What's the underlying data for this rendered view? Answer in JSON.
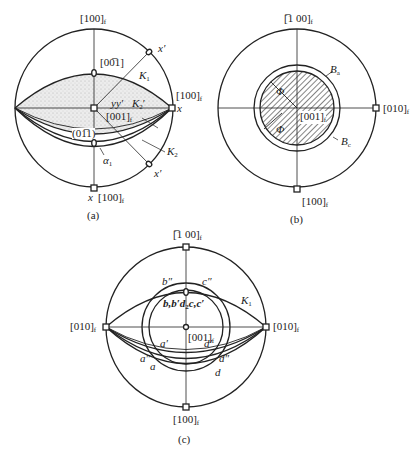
{
  "figure": {
    "panels": [
      {
        "id": "a",
        "caption": "(a)",
        "labels": {
          "top": "[100]",
          "top_sub": "f",
          "right": "[100]",
          "right_sub": "f",
          "right_x": "x",
          "bottom_x": "x",
          "bottom": "[100]",
          "bottom_sub": "f",
          "pole_00-1": "[00̅1]",
          "center": "[001]",
          "center_sub": "f",
          "yy": "yy′",
          "K1": "K",
          "K1_sub": "1",
          "K2p": "K",
          "K2p_sub": "2",
          "K2p_prime": "′",
          "K2": "K",
          "K2_sub": "2",
          "plane": "(01̅1)",
          "alpha": "α",
          "alpha_sub": "1",
          "x_prime_top": "x′",
          "x_prime_bottom": "x′"
        }
      },
      {
        "id": "b",
        "caption": "(b)",
        "labels": {
          "top": "[̅1 00]",
          "top_sub": "f",
          "right": "[010]",
          "right_sub": "f",
          "bottom": "[100]",
          "bottom_sub": "f",
          "center": "[001]",
          "center_sub": "f",
          "Ba": "B",
          "Ba_sub": "a",
          "Bc": "B",
          "Bc_sub": "c",
          "phi1": "Φ",
          "phi2": "Φ"
        }
      },
      {
        "id": "c",
        "caption": "(c)",
        "labels": {
          "top": "[̅1 00]",
          "top_sub": "f",
          "left": "[010]",
          "left_sub": "f",
          "right": "[010]",
          "right_sub": "f",
          "bottom": "[100]",
          "bottom_sub": "f",
          "center": "[001]",
          "center_sub": "f",
          "K1": "K",
          "K1_sub": "1",
          "b2": "b″",
          "c2": "c″",
          "mid": "b,b′d",
          "mid_sub": "2",
          "mid2": "c,c′",
          "a1": "a′",
          "d1": "d′",
          "a2": "a″",
          "d2": "d″",
          "a": "a",
          "d": "d"
        }
      }
    ]
  }
}
